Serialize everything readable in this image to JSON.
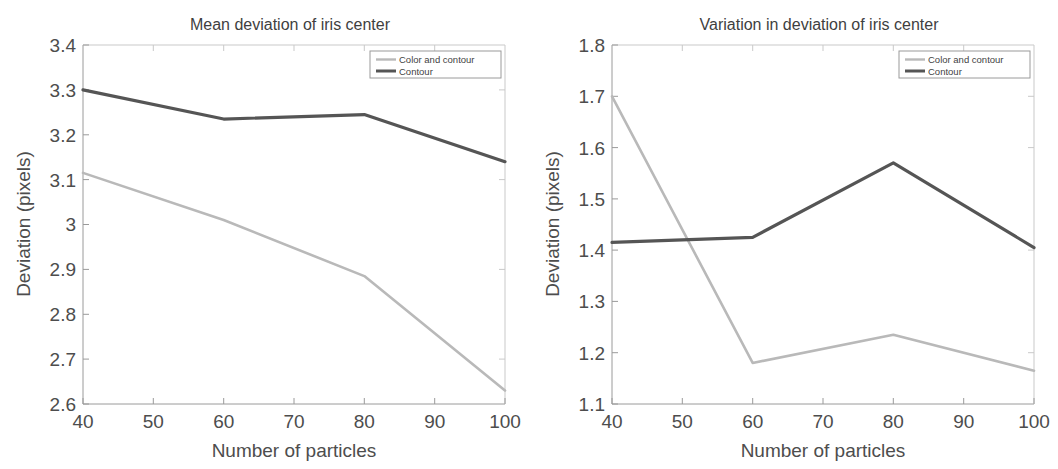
{
  "figure": {
    "background_color": "#ffffff",
    "panel_count": 2
  },
  "series_colors": {
    "color_and_contour": "#b9b9b9",
    "contour": "#555555",
    "axis": "#8c8c8c",
    "text": "#4d4d4d"
  },
  "left_panel": {
    "title": "Mean deviation of iris center",
    "xlabel": "Number of particles",
    "ylabel": "Deviation (pixels)",
    "xticks": [
      "40",
      "50",
      "60",
      "70",
      "80",
      "90",
      "100"
    ],
    "yticks": [
      "2.6",
      "2.7",
      "2.8",
      "2.9",
      "3",
      "3.1",
      "3.2",
      "3.3",
      "3.4"
    ],
    "legend": [
      {
        "label": "Color and contour",
        "color": "#b9b9b9"
      },
      {
        "label": "Contour",
        "color": "#555555"
      }
    ]
  },
  "right_panel": {
    "title": "Variation in deviation of iris center",
    "xlabel": "Number of particles",
    "ylabel": "Deviation (pixels)",
    "xticks": [
      "40",
      "50",
      "60",
      "70",
      "80",
      "90",
      "100"
    ],
    "yticks": [
      "1.1",
      "1.2",
      "1.3",
      "1.4",
      "1.5",
      "1.6",
      "1.7",
      "1.8"
    ],
    "legend": [
      {
        "label": "Color and contour",
        "color": "#b9b9b9"
      },
      {
        "label": "Contour",
        "color": "#555555"
      }
    ]
  },
  "chart_data": [
    {
      "type": "line",
      "title": "Mean deviation of iris center",
      "xlabel": "Number of particles",
      "ylabel": "Deviation (pixels)",
      "x": [
        40,
        60,
        80,
        100
      ],
      "xlim": [
        40,
        100
      ],
      "ylim": [
        2.6,
        3.4
      ],
      "xticks": [
        40,
        50,
        60,
        70,
        80,
        90,
        100
      ],
      "yticks": [
        2.6,
        2.7,
        2.8,
        2.9,
        3.0,
        3.1,
        3.2,
        3.3,
        3.4
      ],
      "grid": false,
      "legend_position": "top-right",
      "series": [
        {
          "name": "Color and contour",
          "color": "#b9b9b9",
          "values": [
            3.115,
            3.01,
            2.885,
            2.63
          ]
        },
        {
          "name": "Contour",
          "color": "#555555",
          "values": [
            3.3,
            3.235,
            3.245,
            3.14
          ]
        }
      ]
    },
    {
      "type": "line",
      "title": "Variation in deviation of iris center",
      "xlabel": "Number of particles",
      "ylabel": "Deviation (pixels)",
      "x": [
        40,
        60,
        80,
        100
      ],
      "xlim": [
        40,
        100
      ],
      "ylim": [
        1.1,
        1.8
      ],
      "xticks": [
        40,
        50,
        60,
        70,
        80,
        90,
        100
      ],
      "yticks": [
        1.1,
        1.2,
        1.3,
        1.4,
        1.5,
        1.6,
        1.7,
        1.8
      ],
      "grid": false,
      "legend_position": "top-right",
      "series": [
        {
          "name": "Color and contour",
          "color": "#b9b9b9",
          "values": [
            1.7,
            1.18,
            1.235,
            1.165
          ]
        },
        {
          "name": "Contour",
          "color": "#555555",
          "values": [
            1.415,
            1.425,
            1.57,
            1.405
          ]
        }
      ]
    }
  ]
}
